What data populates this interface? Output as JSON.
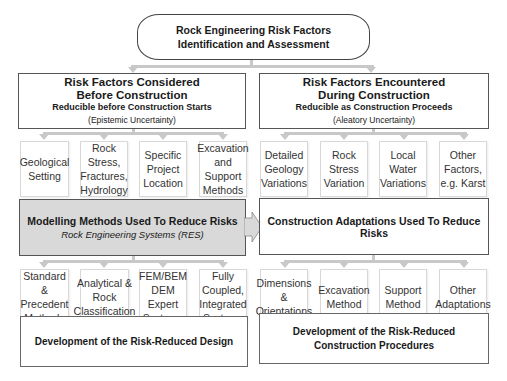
{
  "root": {
    "line1": "Rock Engineering Risk Factors",
    "line2": "Identification and Assessment"
  },
  "left_branch": {
    "title1": "Risk Factors Considered",
    "title2": "Before Construction",
    "subtitle": "Reducible before Construction Starts",
    "note": "(Epistemic Uncertainty)",
    "factors": [
      {
        "lines": [
          "Geological",
          "Setting"
        ]
      },
      {
        "lines": [
          "Rock",
          "Stress,",
          "Fractures,",
          "Hydrology"
        ]
      },
      {
        "lines": [
          "Specific",
          "Project",
          "Location"
        ]
      },
      {
        "lines": [
          "Excavation",
          "and Support",
          "Methods"
        ]
      }
    ],
    "methods_title": "Modelling Methods Used To Reduce Risks",
    "methods_subtitle": "Rock Engineering Systems (RES)",
    "methods": [
      {
        "lines": [
          "Standard &",
          "Precedent",
          "Methods"
        ]
      },
      {
        "lines": [
          "Analytical &",
          "Rock",
          "Classification"
        ]
      },
      {
        "lines": [
          "FEM/BEM",
          "DEM",
          "Expert",
          "Systems"
        ]
      },
      {
        "lines": [
          "Fully",
          "Coupled,",
          "Integrated",
          "Systems"
        ]
      }
    ],
    "outcome": "Development of the Risk-Reduced Design"
  },
  "right_branch": {
    "title1": "Risk Factors Encountered",
    "title2": "During Construction",
    "subtitle": "Reducible as Construction Proceeds",
    "note": "(Aleatory Uncertainty)",
    "factors": [
      {
        "lines": [
          "Detailed",
          "Geology",
          "Variations"
        ]
      },
      {
        "lines": [
          "Rock Stress",
          "Variation"
        ]
      },
      {
        "lines": [
          "Local Water",
          "Variations"
        ]
      },
      {
        "lines": [
          "Other",
          "Factors,",
          "e.g. Karst"
        ]
      }
    ],
    "adaptations_title": "Construction Adaptations Used To Reduce Risks",
    "adaptations": [
      {
        "lines": [
          "Dimensions",
          "&",
          "Orientations"
        ]
      },
      {
        "lines": [
          "Excavation",
          "Method"
        ]
      },
      {
        "lines": [
          "Support",
          "Method"
        ]
      },
      {
        "lines": [
          "Other",
          "Adaptations"
        ]
      }
    ],
    "outcome_line1": "Development of the Risk-Reduced",
    "outcome_line2": "Construction Procedures"
  },
  "colors": {
    "shaded_box": "#d9d9d9",
    "connector": "#c8c8c8",
    "border": "#555555"
  }
}
